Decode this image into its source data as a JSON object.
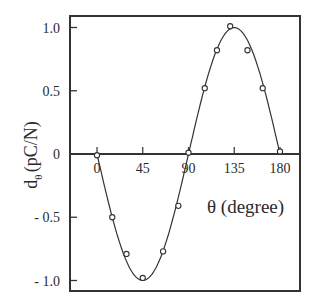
{
  "chart_data": {
    "type": "line",
    "title": "",
    "xlabel": "θ (degree)",
    "ylabel": "dθ (pC/N)",
    "ylabel_main": "d",
    "ylabel_sub": "θ",
    "ylabel_unit": "(pC/N)",
    "x_tick_labels": [
      "0",
      "45",
      "90",
      "135",
      "180"
    ],
    "x_ticks": [
      0,
      45,
      90,
      135,
      180
    ],
    "y_tick_labels": [
      "1.0",
      "0.5",
      "0",
      "- 0.5",
      "- 1.0"
    ],
    "y_ticks": [
      1.0,
      0.5,
      0,
      -0.5,
      -1.0
    ],
    "xlim": [
      -26,
      200
    ],
    "ylim": [
      -1.09,
      1.09
    ],
    "grid": false,
    "legend": null,
    "series": [
      {
        "name": "measured",
        "marker": "open-circle",
        "line": "smooth",
        "x": [
          0,
          15,
          29,
          45,
          65,
          80,
          90,
          106,
          118,
          131,
          148,
          163,
          180
        ],
        "y": [
          -0.01,
          -0.5,
          -0.79,
          -0.98,
          -0.77,
          -0.41,
          0.01,
          0.52,
          0.82,
          1.01,
          0.82,
          0.52,
          0.02
        ]
      }
    ]
  }
}
